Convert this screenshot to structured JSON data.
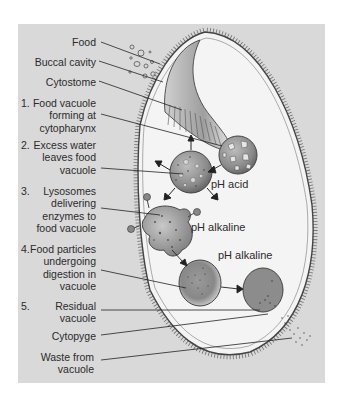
{
  "figure": {
    "background_color": "#d9d9d9",
    "cell_color": "#f4f4f4"
  },
  "labels": {
    "food": "Food",
    "buccal_cavity": "Buccal cavity",
    "cytostome": "Cytostome",
    "cytopyge": "Cytopyge",
    "waste_line1": "Waste from",
    "waste_line2": "vacuole"
  },
  "steps": [
    {
      "number": "1.",
      "lines": [
        "Food vacuole",
        "forming at",
        "cytopharynx"
      ]
    },
    {
      "number": "2.",
      "lines": [
        "Excess water",
        "leaves food",
        "vacuole"
      ]
    },
    {
      "number": "3.",
      "lines": [
        "Lysosomes",
        "delivering",
        "enzymes to",
        "food vacuole"
      ]
    },
    {
      "number": "4.",
      "lines": [
        "Food particles",
        "undergoing",
        "digestion in",
        "vacuole"
      ]
    },
    {
      "number": "5.",
      "lines": [
        "Residual",
        "vacuole"
      ]
    }
  ],
  "ph_labels": {
    "acid": "pH acid",
    "alkaline_1": "pH alkaline",
    "alkaline_2": "pH alkaline"
  }
}
